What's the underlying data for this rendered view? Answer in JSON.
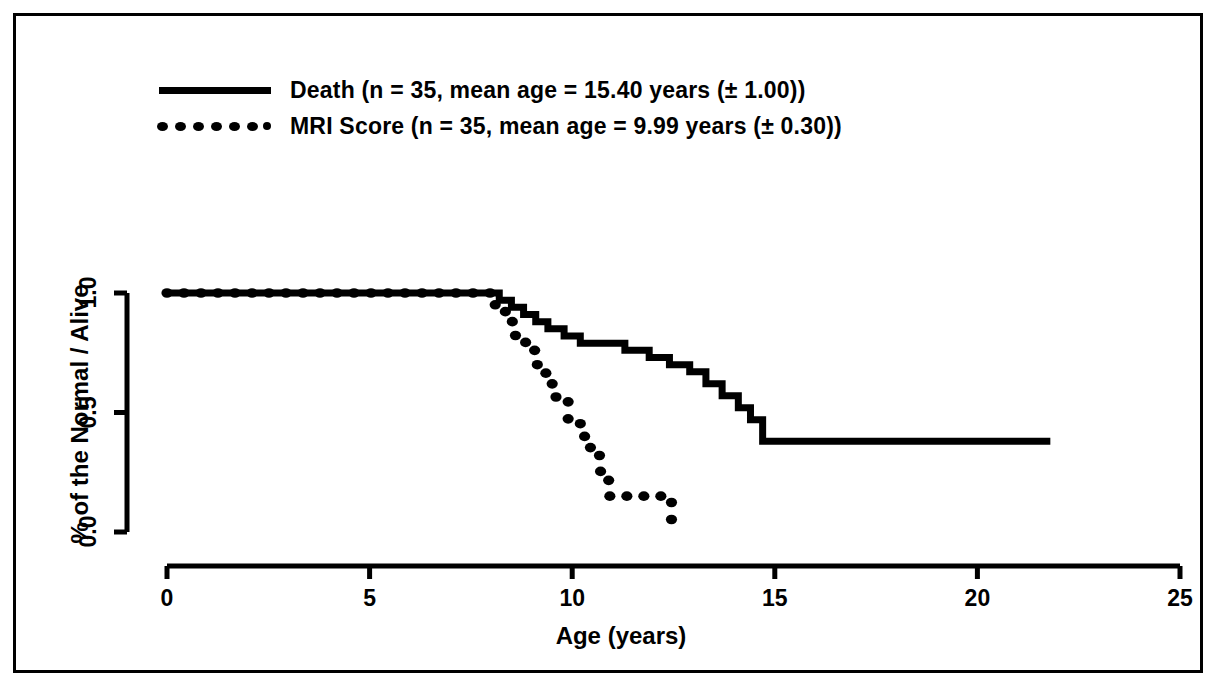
{
  "figure": {
    "border_color": "#000000",
    "background": "#ffffff",
    "ink_color": "#000000"
  },
  "legend": {
    "position": "top-left",
    "entries": [
      {
        "marker": "solid-line-sample",
        "label": "Death (n = 35, mean age = 15.40 years (± 1.00))"
      },
      {
        "marker": "dotted-line-sample",
        "label": "MRI Score (n = 35, mean age = 9.99 years (± 0.30))"
      }
    ]
  },
  "chart_data": {
    "type": "line",
    "title": "",
    "subtitle": "",
    "xlabel": "Age (years)",
    "ylabel": "% of the Normal / Alive",
    "xlim": [
      0,
      25
    ],
    "ylim": [
      0.0,
      1.0
    ],
    "xticks": [
      0,
      5,
      10,
      15,
      20,
      25
    ],
    "xtick_labels": [
      "0",
      "5",
      "10",
      "15",
      "20",
      "25"
    ],
    "yticks": [
      0.0,
      0.5,
      1.0
    ],
    "ytick_labels": [
      "0.0",
      "0.5",
      "1.0"
    ],
    "grid": false,
    "legend_position": "top-left",
    "step_style": "post",
    "series": [
      {
        "name": "Death (n = 35, mean age = 15.40 years (± 1.00))",
        "style": "solid",
        "linewidth": 7,
        "x": [
          0.0,
          7.9,
          8.2,
          8.5,
          8.8,
          9.1,
          9.4,
          9.8,
          10.2,
          10.7,
          11.3,
          11.9,
          12.4,
          12.9,
          13.3,
          13.7,
          14.1,
          14.4,
          14.7,
          21.8
        ],
        "y": [
          1.0,
          1.0,
          0.97,
          0.94,
          0.91,
          0.88,
          0.85,
          0.82,
          0.79,
          0.79,
          0.76,
          0.73,
          0.7,
          0.67,
          0.62,
          0.57,
          0.52,
          0.47,
          0.38,
          0.38
        ]
      },
      {
        "name": "MRI Score (n = 35, mean age = 9.99 years (± 0.30))",
        "style": "dotted",
        "linewidth": 9,
        "x": [
          0.0,
          7.8,
          8.1,
          8.35,
          8.6,
          8.85,
          9.1,
          9.35,
          9.6,
          9.9,
          10.2,
          10.45,
          10.7,
          10.9,
          12.3,
          12.45
        ],
        "y": [
          1.0,
          1.0,
          0.94,
          0.88,
          0.82,
          0.76,
          0.7,
          0.62,
          0.55,
          0.47,
          0.4,
          0.32,
          0.24,
          0.15,
          0.15,
          0.0
        ]
      }
    ]
  }
}
